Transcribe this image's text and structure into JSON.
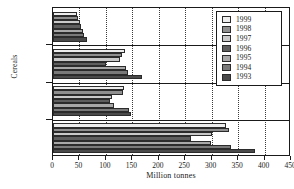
{
  "chart_data": {
    "type": "bar",
    "orientation": "horizontal",
    "title": "",
    "xlabel": "Million tonnes",
    "ylabel": "Cereals",
    "categories": [
      "Rice",
      "Coarse grains",
      "Wheat",
      "Total cereals"
    ],
    "xlim": [
      0,
      450
    ],
    "xticks": [
      0,
      50,
      100,
      150,
      200,
      250,
      300,
      350,
      400,
      450
    ],
    "grid": true,
    "legend_position": "top-right",
    "series": [
      {
        "name": "1999",
        "color": "#ededed",
        "values": [
          45,
          137,
          134,
          327
        ]
      },
      {
        "name": "1998",
        "color": "#8f8f8f",
        "values": [
          48,
          131,
          132,
          333
        ]
      },
      {
        "name": "1997",
        "color": "#c9c9c9",
        "values": [
          51,
          126,
          112,
          301
        ]
      },
      {
        "name": "1996",
        "color": "#5e5e5e",
        "values": [
          53,
          100,
          108,
          260
        ]
      },
      {
        "name": "1995",
        "color": "#a8a8a8",
        "values": [
          56,
          138,
          116,
          299
        ]
      },
      {
        "name": "1994",
        "color": "#7a7a7a",
        "values": [
          59,
          142,
          143,
          336
        ]
      },
      {
        "name": "1993",
        "color": "#4a4a4a",
        "values": [
          64,
          168,
          148,
          382
        ]
      }
    ]
  },
  "legend": {
    "items": [
      {
        "label": "1999"
      },
      {
        "label": "1998"
      },
      {
        "label": "1997"
      },
      {
        "label": "1996"
      },
      {
        "label": "1995"
      },
      {
        "label": "1994"
      },
      {
        "label": "1993"
      }
    ]
  }
}
